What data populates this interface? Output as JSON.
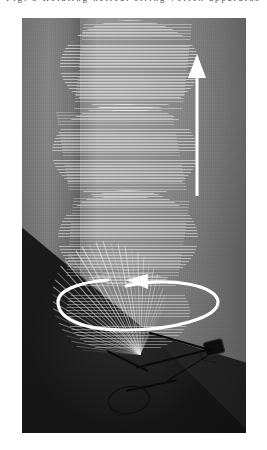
{
  "caption": {
    "text": "Fig. 3  Rotating helical string vortex apparatus",
    "note": "clipped-at-top"
  },
  "figure": {
    "title": "Rotating helical string vortex",
    "photo_label": "helix-photograph",
    "background": {
      "left_wall_color": "#6f6f6f",
      "right_wall_color": "#848484",
      "floor_color": "#1a1a1a",
      "corner_label": "room-corner"
    },
    "subject": {
      "name": "string-helix",
      "description": "Vertical helical envelope formed by rapidly spinning strings",
      "lobe_count": 4,
      "string_color": "#f0f0f0"
    },
    "apparatus": {
      "name": "motor-assembly",
      "description": "Dark motor and support rods at the base of the helix",
      "color": "#0b0b0b"
    }
  },
  "annotations": {
    "vertical_arrow": {
      "name": "wave-direction-arrow",
      "direction": "up",
      "color": "#ffffff",
      "x": 197,
      "y_tip": 60,
      "y_tail": 196
    },
    "rotation_arrow": {
      "name": "rotation-direction-arrow",
      "direction": "counterclockwise",
      "color": "#ffffff",
      "center_x": 126,
      "center_y": 292,
      "radius_x": 82,
      "radius_y": 26
    }
  },
  "colors": {
    "page_background": "#ffffff",
    "annotation": "#ffffff",
    "caption_text": "#575757"
  }
}
